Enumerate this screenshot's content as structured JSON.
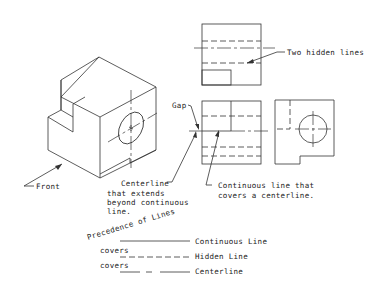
{
  "labels": {
    "front": "Front",
    "gap": "Gap",
    "two_hidden_lines": "Two hidden lines",
    "centerline_note": [
      "Centerline",
      "that extends",
      "beyond continuous",
      "line."
    ],
    "continuous_note": [
      "Continuous line that",
      "covers a centerline."
    ],
    "precedence_title": "Precedence of Lines"
  },
  "precedence": {
    "items": [
      {
        "label": "Continuous Line",
        "style": "continuous"
      },
      {
        "label": "Hidden Line",
        "style": "hidden",
        "prefix": "covers"
      },
      {
        "label": "Centerline",
        "style": "centerline",
        "prefix": "covers"
      }
    ]
  },
  "colors": {
    "line": "#333333",
    "background": "#ffffff"
  }
}
